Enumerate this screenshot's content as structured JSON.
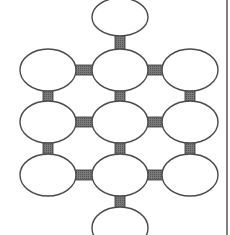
{
  "diagram": {
    "type": "node-grid-graph",
    "colors": {
      "background": "#ffffff",
      "node_fill": "#ffffff",
      "node_stroke": "#4a4a4a",
      "connector_fill": "#6e6e6e",
      "connector_stroke": "#333333",
      "border_line": "#555555"
    },
    "node_size": {
      "rx": 28,
      "ry": 21
    },
    "nodes": [
      {
        "id": "top",
        "cx": 120,
        "cy": 17,
        "ry": 19
      },
      {
        "id": "r1-left",
        "cx": 48,
        "cy": 70
      },
      {
        "id": "r1-mid",
        "cx": 120,
        "cy": 70
      },
      {
        "id": "r1-right",
        "cx": 190,
        "cy": 70
      },
      {
        "id": "r2-left",
        "cx": 48,
        "cy": 122
      },
      {
        "id": "r2-mid",
        "cx": 120,
        "cy": 122
      },
      {
        "id": "r2-right",
        "cx": 190,
        "cy": 122
      },
      {
        "id": "r3-left",
        "cx": 48,
        "cy": 175
      },
      {
        "id": "r3-mid",
        "cx": 120,
        "cy": 175
      },
      {
        "id": "r3-right",
        "cx": 190,
        "cy": 175
      },
      {
        "id": "bottom",
        "cx": 120,
        "cy": 228
      }
    ],
    "edges": [
      [
        "top",
        "r1-mid"
      ],
      [
        "r1-left",
        "r1-mid"
      ],
      [
        "r1-mid",
        "r1-right"
      ],
      [
        "r1-left",
        "r2-left"
      ],
      [
        "r1-mid",
        "r2-mid"
      ],
      [
        "r1-right",
        "r2-right"
      ],
      [
        "r2-left",
        "r2-mid"
      ],
      [
        "r2-mid",
        "r2-right"
      ],
      [
        "r2-left",
        "r3-left"
      ],
      [
        "r2-mid",
        "r3-mid"
      ],
      [
        "r2-right",
        "r3-right"
      ],
      [
        "r3-left",
        "r3-mid"
      ],
      [
        "r3-mid",
        "r3-right"
      ],
      [
        "r3-mid",
        "bottom"
      ]
    ],
    "border_line_x": 227
  }
}
